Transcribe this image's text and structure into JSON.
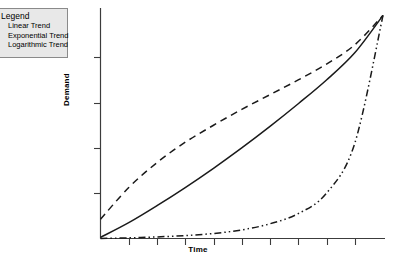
{
  "legend": {
    "title": "Legend",
    "entries": [
      {
        "label": "Linear Trend",
        "style": "solid"
      },
      {
        "label": "Exponential Trend",
        "style": "dash-dot-dot"
      },
      {
        "label": "Logarithmic Trend",
        "style": "dashed"
      }
    ]
  },
  "axes": {
    "xlabel": "Time",
    "ylabel": "Demand"
  },
  "colors": {
    "line": "#1a1a1a",
    "axis": "#3c3c3c",
    "legend_fill": "#e8e8e8",
    "legend_border": "#8a8a8a",
    "background": "#ffffff"
  },
  "chart_data": {
    "type": "line",
    "title": "",
    "subtitle": "",
    "xlabel": "Time",
    "ylabel": "Demand",
    "xlim": [
      0,
      10
    ],
    "ylim": [
      0,
      10
    ],
    "grid": false,
    "xticklabels": [],
    "yticklabels": [],
    "xtick_count": 9,
    "ytick_count": 4,
    "legend_position": "top-left",
    "annotations": [],
    "x": [
      0,
      1,
      2,
      3,
      4,
      5,
      6,
      7,
      8,
      9,
      10
    ],
    "series": [
      {
        "name": "Logarithmic Trend",
        "style": "dashed",
        "values": [
          0.85,
          2.25,
          3.35,
          4.25,
          5.0,
          5.7,
          6.35,
          7.0,
          7.7,
          8.55,
          9.85
        ]
      },
      {
        "name": "Linear Trend",
        "style": "solid",
        "values": [
          0.05,
          0.7,
          1.45,
          2.25,
          3.1,
          4.0,
          4.95,
          5.95,
          7.0,
          8.2,
          9.85
        ]
      },
      {
        "name": "Exponential Trend",
        "style": "dash-dot-dot",
        "values": [
          0.0,
          0.03,
          0.07,
          0.13,
          0.22,
          0.38,
          0.65,
          1.1,
          2.0,
          4.2,
          9.85
        ]
      }
    ]
  }
}
